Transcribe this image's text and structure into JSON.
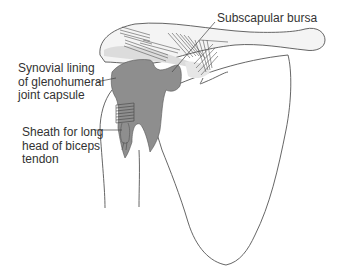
{
  "figure": {
    "colors": {
      "outline": "#555555",
      "synovial_fill": "#8e8e8e",
      "bone_shade": "#e2e2e2",
      "text": "#333333"
    }
  },
  "labels": {
    "subscapular_bursa": "Subscapular bursa",
    "synovial_lining": {
      "line1": "Synovial lining",
      "line2": "of glenohumeral",
      "line3": "joint capsule"
    },
    "biceps_sheath": {
      "line1": "Sheath for long",
      "line2": "head of biceps",
      "line3": "tendon"
    }
  }
}
